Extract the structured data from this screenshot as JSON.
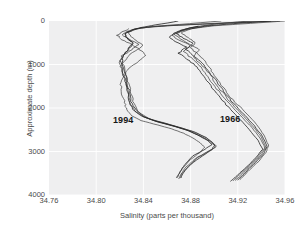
{
  "chart_data": {
    "type": "line",
    "title": "",
    "xlabel": "Salinity (parts per thousand)",
    "ylabel": "Approximate depth (m)",
    "xlim": [
      34.76,
      34.96
    ],
    "ylim": [
      4000,
      0
    ],
    "y_inverted": true,
    "grid": true,
    "legend_position": "inline-annotations",
    "xticks": [
      "34.76",
      "34.80",
      "34.84",
      "34.88",
      "34.92",
      "34.96"
    ],
    "xtick_values": [
      34.76,
      34.8,
      34.84,
      34.88,
      34.92,
      34.96
    ],
    "yticks": [
      "0",
      "1000",
      "2000",
      "3000",
      "4000"
    ],
    "ytick_values": [
      0,
      1000,
      2000,
      3000,
      4000
    ],
    "annotations": [
      {
        "text": "1994",
        "x": 34.842,
        "y": 2250
      },
      {
        "text": "1966",
        "x": 34.918,
        "y": 2230
      }
    ],
    "series": [
      {
        "name": "1994",
        "group": "1994",
        "description": "Repeat hydrographic salinity profiles measured in 1994; fresher deep water than 1966",
        "x": [
          34.955,
          34.9,
          34.86,
          34.838,
          34.83,
          34.824,
          34.826,
          34.832,
          34.828,
          34.824,
          34.822,
          34.823,
          34.826,
          34.828,
          34.83,
          34.834,
          34.84,
          34.852,
          34.866,
          34.878,
          34.888,
          34.896,
          34.9,
          34.898,
          34.89,
          34.88,
          34.874,
          34.872
        ],
        "y": [
          0,
          60,
          110,
          160,
          220,
          300,
          400,
          500,
          620,
          760,
          900,
          1100,
          1350,
          1600,
          1850,
          2050,
          2200,
          2320,
          2420,
          2520,
          2640,
          2760,
          2860,
          2960,
          3100,
          3300,
          3480,
          3600
        ]
      },
      {
        "name": "1994",
        "group": "1994",
        "x": [
          34.94,
          34.888,
          34.852,
          34.834,
          34.826,
          34.822,
          34.828,
          34.836,
          34.83,
          34.822,
          34.82,
          34.822,
          34.825,
          34.827,
          34.829,
          34.833,
          34.842,
          34.856,
          34.87,
          34.882,
          34.892,
          34.898,
          34.902,
          34.896,
          34.886,
          34.878,
          34.873,
          34.871
        ],
        "y": [
          0,
          70,
          120,
          175,
          240,
          320,
          420,
          540,
          660,
          800,
          950,
          1150,
          1400,
          1650,
          1880,
          2080,
          2220,
          2340,
          2440,
          2540,
          2660,
          2780,
          2880,
          2990,
          3140,
          3340,
          3500,
          3610
        ]
      },
      {
        "name": "1994",
        "group": "1994",
        "x": [
          34.905,
          34.87,
          34.846,
          34.832,
          34.827,
          34.829,
          34.834,
          34.84,
          34.833,
          34.826,
          34.823,
          34.824,
          34.827,
          34.83,
          34.832,
          34.836,
          34.845,
          34.86,
          34.872,
          34.884,
          34.893,
          34.899,
          34.901,
          34.894,
          34.884,
          34.876,
          34.872,
          34.87
        ],
        "y": [
          0,
          80,
          130,
          190,
          260,
          350,
          450,
          570,
          690,
          830,
          980,
          1180,
          1430,
          1680,
          1900,
          2100,
          2250,
          2360,
          2460,
          2560,
          2680,
          2800,
          2900,
          3010,
          3160,
          3360,
          3520,
          3620
        ]
      },
      {
        "name": "1994",
        "group": "1994",
        "x": [
          34.87,
          34.85,
          34.838,
          34.83,
          34.824,
          34.826,
          34.831,
          34.828,
          34.824,
          34.821,
          34.821,
          34.824,
          34.826,
          34.828,
          34.831,
          34.838,
          34.85,
          34.864,
          34.876,
          34.886,
          34.894,
          34.898,
          34.892,
          34.882,
          34.875,
          34.871,
          34.869
        ],
        "y": [
          0,
          90,
          150,
          215,
          290,
          390,
          500,
          620,
          760,
          910,
          1090,
          1320,
          1570,
          1820,
          2030,
          2180,
          2300,
          2400,
          2500,
          2620,
          2740,
          2840,
          2950,
          3100,
          3300,
          3470,
          3590
        ]
      },
      {
        "name": "1994",
        "group": "1994",
        "x": [
          34.828,
          34.822,
          34.818,
          34.822,
          34.83,
          34.837,
          34.842,
          34.836,
          34.828,
          34.823,
          34.821,
          34.822,
          34.824,
          34.826,
          34.83,
          34.838,
          34.852,
          34.864,
          34.874,
          34.882,
          34.888,
          34.892,
          34.888,
          34.88,
          34.874,
          34.87,
          34.868
        ],
        "y": [
          180,
          250,
          330,
          430,
          540,
          660,
          790,
          930,
          1080,
          1260,
          1460,
          1680,
          1880,
          2040,
          2180,
          2290,
          2390,
          2480,
          2580,
          2690,
          2800,
          2900,
          3020,
          3180,
          3360,
          3510,
          3600
        ]
      },
      {
        "name": "1966",
        "group": "1966",
        "description": "Repeat hydrographic salinity profiles measured in 1966; saltier deep water than 1994",
        "x": [
          34.96,
          34.93,
          34.9,
          34.88,
          34.872,
          34.878,
          34.884,
          34.88,
          34.886,
          34.892,
          34.896,
          34.9,
          34.906,
          34.912,
          34.92,
          34.928,
          34.936,
          34.942,
          34.946,
          34.944,
          34.938,
          34.93,
          34.925,
          34.922
        ],
        "y": [
          0,
          55,
          110,
          180,
          270,
          380,
          490,
          620,
          760,
          900,
          1060,
          1250,
          1480,
          1700,
          1920,
          2140,
          2380,
          2620,
          2850,
          3020,
          3220,
          3420,
          3560,
          3640
        ]
      },
      {
        "name": "1966",
        "group": "1966",
        "x": [
          34.948,
          34.916,
          34.892,
          34.876,
          34.868,
          34.874,
          34.882,
          34.876,
          34.882,
          34.889,
          34.894,
          34.899,
          34.905,
          34.911,
          34.918,
          34.926,
          34.934,
          34.941,
          34.945,
          34.942,
          34.935,
          34.928,
          34.923,
          34.92
        ],
        "y": [
          0,
          60,
          120,
          195,
          290,
          400,
          510,
          650,
          790,
          930,
          1090,
          1280,
          1510,
          1730,
          1950,
          2170,
          2410,
          2650,
          2880,
          3050,
          3250,
          3440,
          3580,
          3650
        ]
      },
      {
        "name": "1966",
        "group": "1966",
        "x": [
          34.93,
          34.902,
          34.884,
          34.872,
          34.866,
          34.872,
          34.879,
          34.888,
          34.882,
          34.887,
          34.893,
          34.898,
          34.904,
          34.91,
          34.917,
          34.925,
          34.933,
          34.94,
          34.944,
          34.94,
          34.933,
          34.926,
          34.921,
          34.918
        ],
        "y": [
          0,
          70,
          135,
          210,
          305,
          420,
          530,
          670,
          810,
          950,
          1110,
          1300,
          1530,
          1750,
          1970,
          2190,
          2430,
          2670,
          2900,
          3070,
          3270,
          3460,
          3590,
          3660
        ]
      },
      {
        "name": "1966",
        "group": "1966",
        "x": [
          34.898,
          34.88,
          34.87,
          34.864,
          34.87,
          34.88,
          34.874,
          34.88,
          34.886,
          34.891,
          34.896,
          34.902,
          34.909,
          34.916,
          34.924,
          34.932,
          34.939,
          34.943,
          34.938,
          34.931,
          34.924,
          34.919,
          34.916
        ],
        "y": [
          90,
          160,
          240,
          330,
          440,
          560,
          700,
          840,
          980,
          1140,
          1330,
          1560,
          1780,
          2000,
          2220,
          2450,
          2690,
          2920,
          3090,
          3290,
          3470,
          3600,
          3670
        ]
      },
      {
        "name": "1966",
        "group": "1966",
        "x": [
          34.886,
          34.874,
          34.866,
          34.862,
          34.868,
          34.876,
          34.87,
          34.877,
          34.884,
          34.889,
          34.894,
          34.9,
          34.907,
          34.914,
          34.922,
          34.93,
          34.937,
          34.941,
          34.936,
          34.929,
          34.922,
          34.917,
          34.914
        ],
        "y": [
          120,
          200,
          280,
          370,
          480,
          600,
          740,
          880,
          1020,
          1180,
          1370,
          1600,
          1820,
          2040,
          2270,
          2500,
          2740,
          2950,
          3120,
          3320,
          3490,
          3610,
          3680
        ]
      }
    ]
  },
  "axes": {
    "x_title": "Salinity (parts per thousand)",
    "y_title": "Approximate depth (m)",
    "x_tick_labels": [
      "34.76",
      "34.80",
      "34.84",
      "34.88",
      "34.92",
      "34.96"
    ],
    "y_tick_labels": [
      "0",
      "1000",
      "2000",
      "3000",
      "4000"
    ]
  },
  "labels": {
    "series_1994": "1994",
    "series_1966": "1966"
  },
  "colors": {
    "plot_background": "#efeff0",
    "figure_background": "#ffffff",
    "gridline": "#ffffff",
    "line": "#3a3a3a",
    "text": "#4a4a4a",
    "annotation_text": "#161616"
  }
}
